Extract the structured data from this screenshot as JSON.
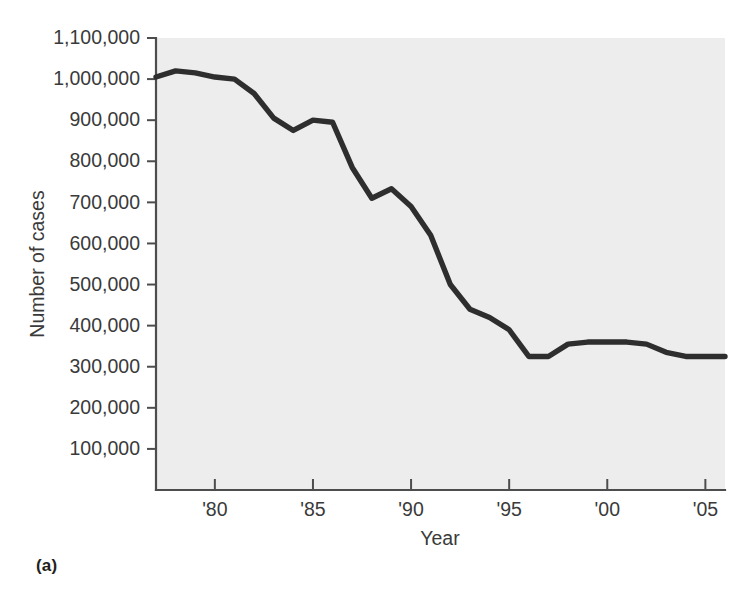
{
  "figure": {
    "panel_label": "(a)",
    "background_color": "#ffffff"
  },
  "chart_data": {
    "type": "line",
    "title": "",
    "subtitle": "",
    "xlabel": "Year",
    "ylabel": "Number of cases",
    "line_color": "#2e2e2e",
    "plot_background_color": "#ededed",
    "axis_color": "#4d4d4d",
    "grid": false,
    "legend": null,
    "xlim": [
      1977,
      2006
    ],
    "ylim": [
      0,
      1100000
    ],
    "x_tick_values": [
      1980,
      1985,
      1990,
      1995,
      2000,
      2005
    ],
    "x_tick_labels": [
      "'80",
      "'85",
      "'90",
      "'95",
      "'00",
      "'05"
    ],
    "y_tick_values": [
      100000,
      200000,
      300000,
      400000,
      500000,
      600000,
      700000,
      800000,
      900000,
      1000000,
      1100000
    ],
    "y_tick_labels": [
      "100,000",
      "200,000",
      "300,000",
      "400,000",
      "500,000",
      "600,000",
      "700,000",
      "800,000",
      "900,000",
      "1,000,000",
      "1,100,000"
    ],
    "x": [
      1977,
      1978,
      1979,
      1980,
      1981,
      1982,
      1983,
      1984,
      1985,
      1986,
      1987,
      1988,
      1989,
      1990,
      1991,
      1992,
      1993,
      1994,
      1995,
      1996,
      1997,
      1998,
      1999,
      2000,
      2001,
      2002,
      2003,
      2004,
      2005,
      2006
    ],
    "values": [
      1005000,
      1020000,
      1015000,
      1005000,
      1000000,
      965000,
      905000,
      875000,
      900000,
      895000,
      785000,
      710000,
      733000,
      690000,
      620000,
      500000,
      440000,
      420000,
      390000,
      325000,
      325000,
      355000,
      360000,
      360000,
      360000,
      355000,
      335000,
      325000,
      325000,
      325000
    ]
  }
}
